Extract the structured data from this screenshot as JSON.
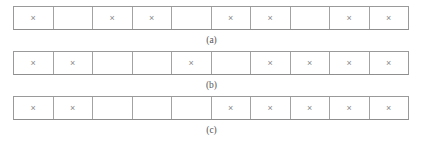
{
  "figure": {
    "mark_glyph": "×",
    "mark_color": "#8a8a8a",
    "border_color": "#9a9a9a",
    "cell_count": 10,
    "panels": [
      {
        "id": "a",
        "caption": "(a)",
        "cells": [
          "×",
          "",
          "×",
          "×",
          "",
          "×",
          "×",
          "",
          "×",
          "×"
        ]
      },
      {
        "id": "b",
        "caption": "(b)",
        "cells": [
          "×",
          "×",
          "",
          "",
          "×",
          "",
          "×",
          "×",
          "×",
          "×"
        ]
      },
      {
        "id": "c",
        "caption": "(c)",
        "cells": [
          "×",
          "×",
          "",
          "",
          "",
          "×",
          "×",
          "×",
          "×",
          "×"
        ]
      }
    ]
  }
}
